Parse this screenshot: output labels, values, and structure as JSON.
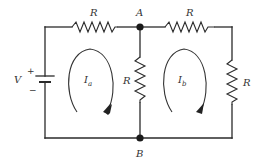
{
  "diagram": {
    "type": "circuit",
    "components": {
      "source": {
        "label": "V",
        "plus": "+",
        "minus": "−"
      },
      "resistor_top_left": {
        "label": "R"
      },
      "resistor_top_right": {
        "label": "R"
      },
      "resistor_middle": {
        "label": "R"
      },
      "resistor_right": {
        "label": "R"
      }
    },
    "nodes": {
      "top": {
        "label": "A"
      },
      "bottom": {
        "label": "B"
      }
    },
    "loops": [
      {
        "current": "I",
        "subscript": "a",
        "direction": "clockwise"
      },
      {
        "current": "I",
        "subscript": "b",
        "direction": "clockwise"
      }
    ],
    "colors": {
      "stroke": "#2a2a2a",
      "background": "#ffffff"
    }
  }
}
